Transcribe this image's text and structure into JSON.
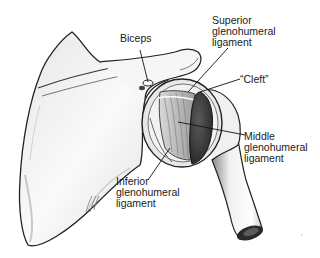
{
  "figure": {
    "labels": {
      "biceps": "Biceps",
      "superior": "Superior\nglenohumeral\nligament",
      "cleft": "“Cleft”",
      "middle": "Middle\nglenohumeral\nligament",
      "inferior": "Inferior\nglenohumeral\nligament"
    },
    "signature": "JRD"
  },
  "colors": {
    "background": "#ffffff",
    "bone_fill": "#f4f4f4",
    "outline": "#222222",
    "shadow": "#9a9a9a",
    "dark_humeral_head": "#3a3a3a",
    "ligament": "#b8b8b8"
  }
}
